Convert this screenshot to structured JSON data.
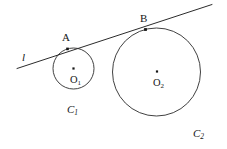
{
  "figure": {
    "type": "euclidean-geometry-diagram",
    "background_color": "#ffffff",
    "stroke_color": "#2b2b2b",
    "label_color": "#161616"
  },
  "line": {
    "name": "tangent-line",
    "label": "l",
    "label_style": "italic",
    "label_x": 22,
    "label_y": 52,
    "x1": 17,
    "y1": 68.5,
    "x2": 212,
    "y2": 4.5,
    "stroke_width": 1.0
  },
  "circles": [
    {
      "id": "C1",
      "name": "small-circle",
      "label": "C",
      "label_sub": "1",
      "label_x": 67,
      "label_y": 104,
      "cx": 73.5,
      "cy": 68.5,
      "r": 20.5,
      "stroke_width": 0.9,
      "center": {
        "name": "center-O1",
        "label": "O",
        "label_sub": "1",
        "x": 73.5,
        "y": 68.5,
        "dot_size": 2.2,
        "label_x": 70,
        "label_y": 75
      },
      "tangent_point": {
        "name": "point-A",
        "label": "A",
        "x": 67.5,
        "y": 48.9,
        "dot_size": 2.6,
        "label_x": 62,
        "label_y": 32
      }
    },
    {
      "id": "C2",
      "name": "large-circle",
      "label": "C",
      "label_sub": "2",
      "label_x": 193,
      "label_y": 128,
      "cx": 156.5,
      "cy": 72.0,
      "r": 44.0,
      "stroke_width": 0.9,
      "center": {
        "name": "center-O2",
        "label": "O",
        "label_sub": "2",
        "x": 157,
        "y": 71.5,
        "dot_size": 2.2,
        "label_x": 153,
        "label_y": 78
      },
      "tangent_point": {
        "name": "point-B",
        "label": "B",
        "x": 145.5,
        "y": 29.5,
        "dot_size": 2.8,
        "label_x": 140,
        "label_y": 13
      }
    }
  ]
}
